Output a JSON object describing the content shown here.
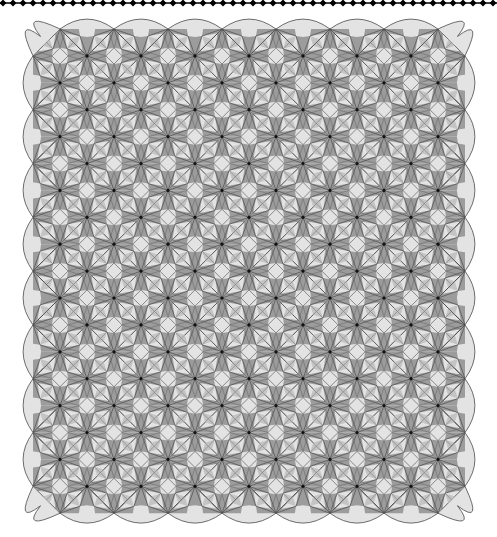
{
  "image": {
    "width": 497,
    "height": 537,
    "background": "#ffffff",
    "description": "Quilt-like geometric star tessellation with scalloped border"
  },
  "top_border": {
    "y": 3,
    "start_x": 3,
    "spacing": 10,
    "count": 50,
    "diamond_half": 3.5,
    "color": "#000000"
  },
  "lattice": {
    "origin_x": 33,
    "origin_y": 29,
    "unit_x": 27,
    "unit_y": 26.9,
    "cols": 16,
    "rows": 18,
    "vertex_dot_radius": 1.6,
    "cap_bulge": 9
  },
  "colors": {
    "light": "#e3e3e3",
    "mid": "#c4c4c4",
    "dark": "#9c9c9c",
    "line": "#4a4a4a",
    "dot": "#111111"
  },
  "tile": {
    "center_diamond": 0.3,
    "inner_star": 0.52,
    "spike_width": 0.16
  }
}
